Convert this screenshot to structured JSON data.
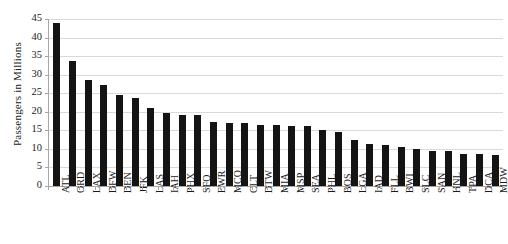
{
  "chart_data": {
    "type": "bar",
    "title": "",
    "subtitle": "",
    "xlabel": "",
    "ylabel": "Passengers in Millions",
    "ylim": [
      0,
      45
    ],
    "yticks": [
      0,
      5,
      10,
      15,
      20,
      25,
      30,
      35,
      40,
      45
    ],
    "grid": true,
    "legend": false,
    "bar_color": "#141414",
    "gridline_color": "#d9d9d9",
    "axis_color": "#a6a6a6",
    "background_color": "#ffffff",
    "categories": [
      "ATL",
      "ORD",
      "LAX",
      "DFW",
      "DEN",
      "JFK",
      "LAS",
      "IAH",
      "PHX",
      "SFO",
      "EWR",
      "MCO",
      "CLT",
      "DTW",
      "MIA",
      "MSP",
      "SEA",
      "PHL",
      "BOS",
      "LGA",
      "IAD",
      "FLL",
      "BWI",
      "SLC",
      "SAN",
      "HNL",
      "TPA",
      "DCA",
      "MDW"
    ],
    "values": [
      43.8,
      33.7,
      28.6,
      27.3,
      24.4,
      23.6,
      21.0,
      19.7,
      19.2,
      19.1,
      17.2,
      17.1,
      16.9,
      16.4,
      16.4,
      16.2,
      16.1,
      15.2,
      14.5,
      12.4,
      11.3,
      11.1,
      10.5,
      9.9,
      9.5,
      9.4,
      8.6,
      8.6,
      8.3
    ]
  }
}
